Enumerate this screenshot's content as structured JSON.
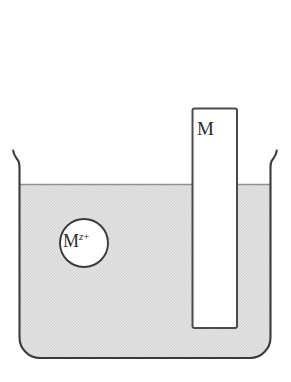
{
  "figure": {
    "type": "electrochemical-half-cell-diagram",
    "background_color": "#ffffff"
  },
  "beaker": {
    "name": "beaker",
    "outline_color": "#3a3a3a",
    "outline_width": 2,
    "left_wall_x": 18,
    "right_wall_x": 272,
    "rim_y": 150,
    "bottom_y": 358,
    "corner_radius": 20
  },
  "solution": {
    "name": "electrolyte-solution",
    "fill_color": "#dedede",
    "surface_y": 184,
    "surface_line_color": "#8a8a8a",
    "texture": "stipple"
  },
  "electrode": {
    "name": "metal-electrode",
    "label": "M",
    "fill_color": "#ffffff",
    "outline_color": "#4a4a4a",
    "x": 192,
    "y": 108,
    "width": 45,
    "height": 220
  },
  "ion": {
    "name": "metal-ion",
    "symbol": "M",
    "superscript_variable": "z",
    "superscript_charge": "+",
    "full_label": "M z+",
    "circle_fill": "#ffffff",
    "circle_stroke": "#3a3a3a",
    "center_x": 84,
    "center_y": 243,
    "radius": 24
  }
}
